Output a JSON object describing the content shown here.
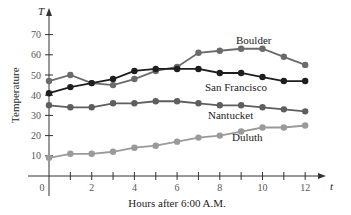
{
  "chart_data": {
    "type": "line",
    "title": "",
    "xlabel": "Hours after 6:00 A.M.",
    "ylabel": "Temperature",
    "x_axis_letter": "t",
    "y_axis_letter": "T",
    "xlim": [
      0,
      12
    ],
    "ylim": [
      0,
      70
    ],
    "x_ticks": [
      0,
      1,
      2,
      3,
      4,
      5,
      6,
      7,
      8,
      9,
      10,
      11,
      12
    ],
    "x_tick_labels": [
      "0",
      "2",
      "4",
      "6",
      "8",
      "10",
      "12"
    ],
    "y_tick_labels": [
      "10",
      "20",
      "30",
      "40",
      "50",
      "60",
      "70"
    ],
    "grid": false,
    "legend": "inline labels",
    "x": [
      0,
      1,
      2,
      3,
      4,
      5,
      6,
      7,
      8,
      9,
      10,
      11,
      12
    ],
    "series": [
      {
        "name": "Boulder",
        "color": "#6b6b6b",
        "values": [
          47,
          50,
          46,
          45,
          48,
          52,
          54,
          61,
          62,
          63,
          63,
          59,
          55
        ]
      },
      {
        "name": "San Francisco",
        "color": "#1e1e1e",
        "values": [
          41,
          44,
          46,
          48,
          52,
          53,
          53,
          53,
          51,
          51,
          49,
          47,
          47
        ]
      },
      {
        "name": "Nantucket",
        "color": "#5e5e5e",
        "values": [
          35,
          34,
          34,
          36,
          36,
          37,
          37,
          36,
          35,
          35,
          34,
          33,
          32
        ]
      },
      {
        "name": "Duluth",
        "color": "#9a9a9a",
        "values": [
          9,
          11,
          11,
          12,
          14,
          15,
          17,
          19,
          20,
          22,
          24,
          24,
          25
        ]
      }
    ]
  }
}
